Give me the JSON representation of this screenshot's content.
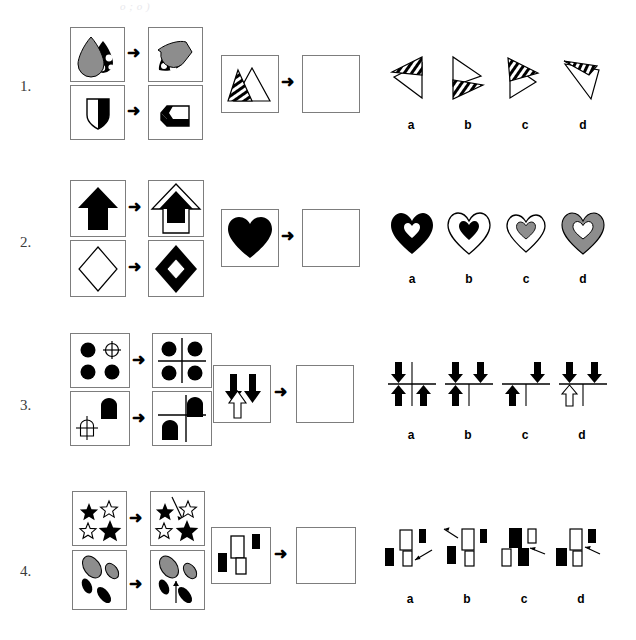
{
  "page": {
    "header_faint_text": "o  ;    o                       )",
    "background_color": "#ffffff",
    "gray_fill": "#8d8d8d",
    "black_fill": "#000000",
    "panel_border_color": "#7d7d7d",
    "arrow_glyph": "➜"
  },
  "rows": [
    {
      "number": "1.",
      "analogy_top": {
        "source_label": "gray-teardrop-and-spotted-teardrop",
        "result_label": "rotated-gray-teardrop-and-spotted-teardrop"
      },
      "analogy_bottom": {
        "source_label": "half-white-half-black-shield",
        "result_label": "rotated-half-white-half-black-shield"
      },
      "question": {
        "prompt_label": "striped-triangle-and-white-triangle",
        "answer_label": "empty-answer-box"
      },
      "options": [
        {
          "key": "a",
          "label": "striped-triangle-top-left-pointing-white-triangle"
        },
        {
          "key": "b",
          "label": "white-triangle-with-striped-triangle-below"
        },
        {
          "key": "c",
          "label": "striped-triangle-over-white-triangle-right"
        },
        {
          "key": "d",
          "label": "rotated-striped-and-white-triangles"
        }
      ]
    },
    {
      "number": "2.",
      "analogy_top": {
        "source_label": "solid-black-arrow-up",
        "result_label": "black-arrow-inside-white-outlined-arrow"
      },
      "analogy_bottom": {
        "source_label": "white-outlined-diamond",
        "result_label": "white-diamond-inside-black-diamond"
      },
      "question": {
        "prompt_label": "solid-black-heart",
        "answer_label": "empty-answer-box"
      },
      "options": [
        {
          "key": "a",
          "label": "black-heart-with-white-inner-heart"
        },
        {
          "key": "b",
          "label": "white-heart-with-black-inner-heart"
        },
        {
          "key": "c",
          "label": "white-heart-with-gray-inner-heart"
        },
        {
          "key": "d",
          "label": "gray-heart-with-white-inner-heart"
        }
      ]
    },
    {
      "number": "3.",
      "analogy_top": {
        "source_label": "three-black-circles-and-one-crosshair-circle",
        "result_label": "four-black-circles-with-crosshair-lines"
      },
      "analogy_bottom": {
        "source_label": "black-pentagon-tag-and-crosshair-tag",
        "result_label": "two-black-tags-with-crosshair-lines"
      },
      "question": {
        "prompt_label": "two-black-down-arrows-and-one-white-up-arrow",
        "answer_label": "empty-answer-box"
      },
      "options": [
        {
          "key": "a",
          "label": "two-black-down-arrows-two-black-up-arrows-crosshair"
        },
        {
          "key": "b",
          "label": "two-black-down-arrows-one-black-up-arrow-left-crosshair"
        },
        {
          "key": "c",
          "label": "one-black-down-arrow-right-one-black-up-arrow-left-crosshair"
        },
        {
          "key": "d",
          "label": "two-black-down-arrows-one-white-up-arrow-crosshair"
        }
      ]
    },
    {
      "number": "4.",
      "analogy_top": {
        "source_label": "two-black-stars-two-white-stars",
        "result_label": "stars-with-diagonal-pointer-arrow"
      },
      "analogy_bottom": {
        "source_label": "two-gray-ellipses-two-black-ellipses",
        "result_label": "ellipses-with-upward-pointer-arrow"
      },
      "question": {
        "prompt_label": "white-and-black-rectangles-group",
        "answer_label": "empty-answer-box"
      },
      "options": [
        {
          "key": "a",
          "label": "rectangles-with-arrow-pointing-to-lower-white-rectangle"
        },
        {
          "key": "b",
          "label": "rectangles-with-arrow-pointing-up-left-outside"
        },
        {
          "key": "c",
          "label": "rectangles-with-arrow-pointing-to-middle-black-rectangle"
        },
        {
          "key": "d",
          "label": "rectangles-with-arrow-pointing-to-upper-white-rectangle"
        }
      ]
    }
  ]
}
